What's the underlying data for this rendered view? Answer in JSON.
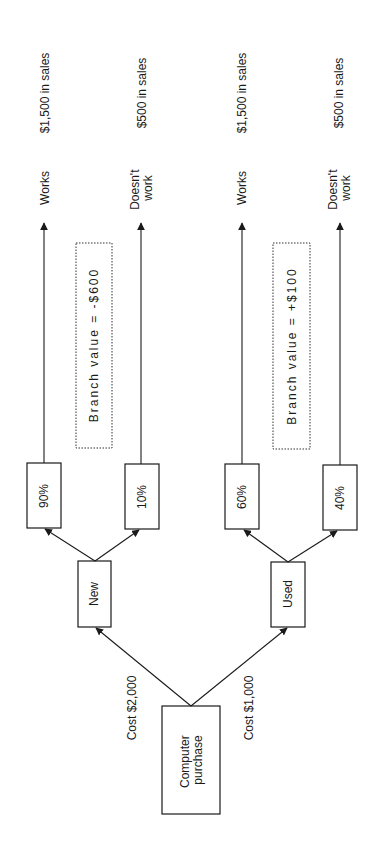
{
  "diagram": {
    "type": "decision-tree",
    "root": {
      "label_lines": [
        "Computer",
        "purchase"
      ]
    },
    "branches": [
      {
        "id": "new",
        "label": "New",
        "cost_label": "Cost $2,000",
        "branch_value": "Branch value = -$600",
        "outcomes": [
          {
            "probability": "90%",
            "result": "Works",
            "result_lines": [
              "Works"
            ],
            "payoff": "$1,500 in sales"
          },
          {
            "probability": "10%",
            "result": "Doesn't work",
            "result_lines": [
              "Doesn't",
              "work"
            ],
            "payoff": "$500 in sales"
          }
        ]
      },
      {
        "id": "used",
        "label": "Used",
        "cost_label": "Cost $1,000",
        "branch_value": "Branch value = +$100",
        "outcomes": [
          {
            "probability": "60%",
            "result": "Works",
            "result_lines": [
              "Works"
            ],
            "payoff": "$1,500 in sales"
          },
          {
            "probability": "40%",
            "result": "Doesn't work",
            "result_lines": [
              "Doesn't",
              "work"
            ],
            "payoff": "$500 in sales"
          }
        ]
      }
    ]
  }
}
